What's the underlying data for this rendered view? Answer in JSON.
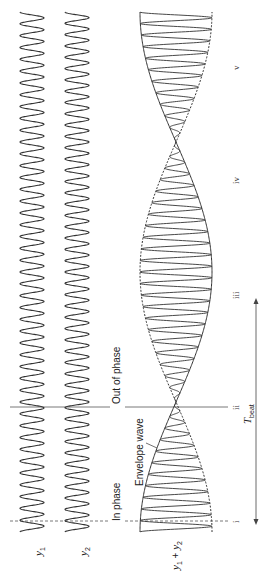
{
  "diagram": {
    "colors": {
      "wave": "#333333",
      "line": "#555555",
      "text": "#222222",
      "background": "#ffffff"
    },
    "waves": {
      "y1": {
        "label_var": "y",
        "label_sub": "1",
        "center_x": 32,
        "amplitude": 12,
        "cycles": 44
      },
      "y2": {
        "label_var": "y",
        "label_sub": "2",
        "center_x": 77,
        "amplitude": 12,
        "cycles": 46
      },
      "sum": {
        "label": "y1 + y2",
        "label_var1": "y",
        "label_sub1": "1",
        "label_plus": " + ",
        "label_var2": "y",
        "label_sub2": "2",
        "center_x": 176,
        "amplitude": 36
      }
    },
    "time_axis": {
      "start_y": 532,
      "end_y": 12
    },
    "annotations": {
      "in_phase": "In phase",
      "out_of_phase": "Out of phase",
      "envelope_wave": "Envelope wave",
      "beat_period_var": "T",
      "beat_period_sub": "beat"
    },
    "markers": [
      {
        "label": "i",
        "y": 521
      },
      {
        "label": "ii",
        "y": 407
      },
      {
        "label": "iii",
        "y": 294
      },
      {
        "label": "iv",
        "y": 181
      },
      {
        "label": "v",
        "y": 68
      }
    ],
    "beat_arrow": {
      "x": 256,
      "from_y": 298,
      "to_y": 525
    }
  }
}
